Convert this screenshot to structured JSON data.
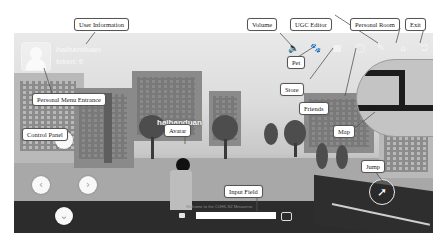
{
  "hud": {
    "username": "haihanduan",
    "token_label": "token: 0",
    "avatar_nameplate": "haihanduan",
    "chat_hint": "Welcome to the CUHK-SZ Metaverse",
    "chat_placeholder": ""
  },
  "top_icons": [
    {
      "name": "volume-icon",
      "glyph": "🔈"
    },
    {
      "name": "pet-icon",
      "glyph": "🐾"
    },
    {
      "name": "store-icon",
      "glyph": "▦"
    },
    {
      "name": "friends-icon",
      "glyph": "◯"
    },
    {
      "name": "ugc-editor-icon",
      "glyph": "✎"
    },
    {
      "name": "personal-room-icon",
      "glyph": "⌂"
    },
    {
      "name": "exit-icon",
      "glyph": "⎋"
    }
  ],
  "controls": {
    "up": "⌃",
    "left": "‹",
    "right": "›",
    "down": "⌄",
    "jump": "➚"
  },
  "callouts": {
    "user_information": "User Information",
    "personal_menu_entrance": "Personal Menu Entrance",
    "volume": "Volume",
    "pet": "Pet",
    "store": "Store",
    "ugc_editor": "UGC Editor",
    "friends": "Friends",
    "personal_room": "Personal Room",
    "exit": "Exit",
    "map": "Map",
    "control_panel": "Control Panel",
    "avatar": "Avatar",
    "input_field": "Input Field",
    "jump": "Jump"
  },
  "colors": {
    "hud_white": "#f7f7f7",
    "callout_border": "#555555",
    "road": "#2c2c2c"
  }
}
